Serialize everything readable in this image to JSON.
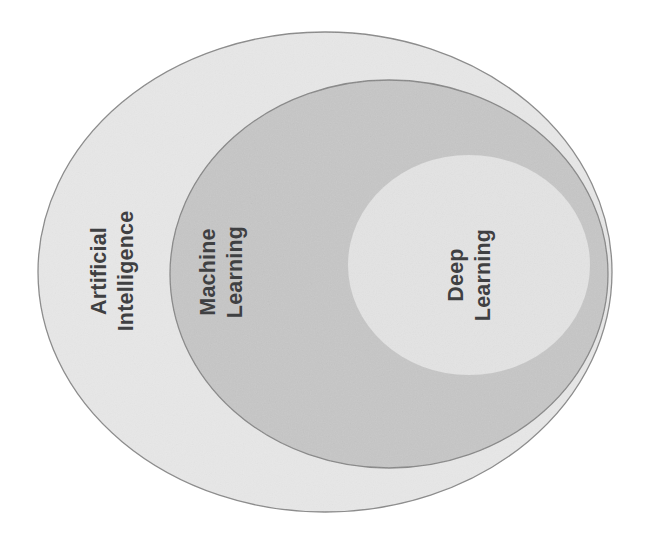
{
  "canvas": {
    "width": 654,
    "height": 543,
    "background": "#ffffff"
  },
  "diagram": {
    "type": "nested-ellipse-venn",
    "relationship": "Deep Learning is a subset of Machine Learning, which is a subset of Artificial Intelligence"
  },
  "sets": [
    {
      "id": "artificial-intelligence",
      "label_line1": "Artificial",
      "label_line2": "Intelligence",
      "full_label": "Artificial Intelligence",
      "level": 1,
      "fill": "#e7e7e7",
      "stroke": "#8a8a8a",
      "stroke_width": 1.3,
      "text_color": "#3f4042",
      "text_rotation": -90,
      "geometry": {
        "cx": 325,
        "cy": 272,
        "rx": 287,
        "ry": 240
      },
      "label_position": {
        "x": 113,
        "y": 271
      }
    },
    {
      "id": "machine-learning",
      "label_line1": "Machine",
      "label_line2": "Learning",
      "full_label": "Machine Learning",
      "level": 2,
      "fill": "#c6c6c6",
      "stroke": "#878787",
      "stroke_width": 1.3,
      "text_color": "#3f4042",
      "text_rotation": -90,
      "geometry": {
        "cx": 389,
        "cy": 274,
        "rx": 219,
        "ry": 194
      },
      "label_position": {
        "x": 222,
        "y": 272
      }
    },
    {
      "id": "deep-learning",
      "label_line1": "Deep",
      "label_line2": "Learning",
      "full_label": "Deep Learning",
      "level": 3,
      "fill": "#e3e3e3",
      "stroke": "none",
      "stroke_width": 0,
      "text_color": "#3f4042",
      "text_rotation": -90,
      "geometry": {
        "cx": 469,
        "cy": 265,
        "rx": 121,
        "ry": 110
      },
      "label_position": {
        "x": 470,
        "y": 275
      }
    }
  ],
  "colors": {
    "outer_fill": "#e7e7e7",
    "middle_fill": "#c6c6c6",
    "inner_fill": "#e3e3e3",
    "stroke": "#8a8a8a",
    "text": "#3f4042",
    "background": "#ffffff"
  }
}
